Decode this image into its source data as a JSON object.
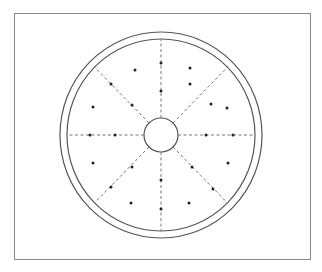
{
  "diagram": {
    "center": [
      161,
      135
    ],
    "outer_ring_radius": [
      101,
      103
    ],
    "inner_ring_radius": [
      94,
      96
    ],
    "hub_radius": 17,
    "radial_lines": 8,
    "line_color": "#555555",
    "dot_color": "#222222",
    "dots": [
      [
        161,
        63
      ],
      [
        161,
        91
      ],
      [
        161,
        180
      ],
      [
        161,
        209
      ],
      [
        90,
        135
      ],
      [
        115,
        135
      ],
      [
        206,
        135
      ],
      [
        233,
        135
      ],
      [
        111,
        84
      ],
      [
        132,
        105
      ],
      [
        190,
        84
      ],
      [
        211,
        104
      ],
      [
        132,
        167
      ],
      [
        111,
        187
      ],
      [
        192,
        167
      ],
      [
        213,
        189
      ],
      [
        135,
        70
      ],
      [
        190,
        68
      ],
      [
        93,
        107
      ],
      [
        227,
        108
      ],
      [
        93,
        163
      ],
      [
        131,
        203
      ],
      [
        228,
        163
      ],
      [
        189,
        203
      ]
    ]
  }
}
